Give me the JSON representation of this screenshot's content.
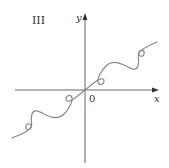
{
  "figure": {
    "panel_label": "III",
    "x_axis_label": "x",
    "y_axis_label": "y",
    "origin_label": "0",
    "colors": {
      "axis": "#555555",
      "curve": "#8a8a8a",
      "text": "#333333",
      "background": "#ffffff"
    }
  }
}
